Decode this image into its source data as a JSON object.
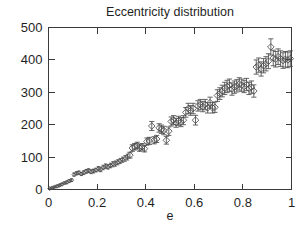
{
  "chart_data": {
    "type": "scatter",
    "title": "Eccentricity distribution",
    "xlabel": "e",
    "ylabel": "",
    "xlim": [
      0,
      1
    ],
    "ylim": [
      0,
      500
    ],
    "grid": false,
    "legend": null,
    "marker": "open-diamond",
    "errorbars": "vertical",
    "xticks": [
      0,
      0.2,
      0.4,
      0.6,
      0.8,
      1
    ],
    "xtick_labels": [
      "0",
      "0.2",
      "0.4",
      "0.6",
      "0.8",
      "1"
    ],
    "yticks": [
      0,
      100,
      200,
      300,
      400,
      500
    ],
    "ytick_labels": [
      "0",
      "100",
      "200",
      "300",
      "400",
      "500"
    ],
    "series": [
      {
        "name": "Eccentricity distribution",
        "x": [
          0.005,
          0.015,
          0.025,
          0.035,
          0.045,
          0.055,
          0.065,
          0.075,
          0.085,
          0.095,
          0.105,
          0.115,
          0.125,
          0.135,
          0.145,
          0.155,
          0.165,
          0.175,
          0.185,
          0.195,
          0.205,
          0.215,
          0.225,
          0.235,
          0.245,
          0.255,
          0.265,
          0.275,
          0.285,
          0.295,
          0.305,
          0.315,
          0.325,
          0.335,
          0.345,
          0.355,
          0.365,
          0.375,
          0.385,
          0.395,
          0.405,
          0.415,
          0.425,
          0.435,
          0.445,
          0.455,
          0.465,
          0.475,
          0.485,
          0.495,
          0.505,
          0.515,
          0.525,
          0.535,
          0.545,
          0.555,
          0.565,
          0.575,
          0.585,
          0.595,
          0.605,
          0.615,
          0.625,
          0.635,
          0.645,
          0.655,
          0.665,
          0.675,
          0.685,
          0.695,
          0.705,
          0.715,
          0.725,
          0.735,
          0.745,
          0.755,
          0.765,
          0.775,
          0.785,
          0.795,
          0.805,
          0.815,
          0.825,
          0.835,
          0.845,
          0.855,
          0.865,
          0.875,
          0.885,
          0.895,
          0.905,
          0.915,
          0.925,
          0.935,
          0.945,
          0.955,
          0.965,
          0.975,
          0.985,
          0.995
        ],
        "y": [
          3,
          5,
          8,
          10,
          13,
          16,
          20,
          22,
          26,
          29,
          46,
          50,
          52,
          48,
          52,
          56,
          58,
          55,
          57,
          60,
          64,
          62,
          68,
          72,
          70,
          74,
          78,
          80,
          84,
          88,
          92,
          96,
          100,
          106,
          128,
          132,
          136,
          128,
          132,
          126,
          148,
          150,
          196,
          152,
          156,
          190,
          186,
          182,
          152,
          180,
          210,
          214,
          206,
          212,
          208,
          214,
          238,
          250,
          244,
          250,
          214,
          258,
          262,
          256,
          262,
          252,
          268,
          252,
          254,
          290,
          296,
          304,
          312,
          318,
          322,
          310,
          316,
          320,
          326,
          322,
          318,
          324,
          312,
          316,
          304,
          378,
          384,
          372,
          382,
          388,
          396,
          440,
          406,
          402,
          410,
          404,
          398,
          402,
          400,
          404
        ],
        "yerr": [
          2,
          2,
          2,
          3,
          3,
          3,
          3,
          4,
          4,
          4,
          5,
          5,
          5,
          5,
          6,
          6,
          6,
          6,
          6,
          6,
          7,
          7,
          7,
          7,
          7,
          7,
          8,
          8,
          8,
          8,
          8,
          9,
          9,
          9,
          10,
          10,
          10,
          10,
          10,
          10,
          11,
          11,
          14,
          11,
          11,
          13,
          13,
          13,
          12,
          13,
          14,
          14,
          14,
          14,
          14,
          14,
          15,
          16,
          15,
          16,
          15,
          16,
          16,
          16,
          16,
          16,
          17,
          16,
          16,
          18,
          18,
          18,
          19,
          19,
          19,
          19,
          19,
          19,
          19,
          19,
          19,
          19,
          19,
          19,
          19,
          22,
          22,
          22,
          22,
          22,
          23,
          25,
          24,
          24,
          24,
          24,
          24,
          24,
          24,
          24
        ]
      }
    ]
  }
}
